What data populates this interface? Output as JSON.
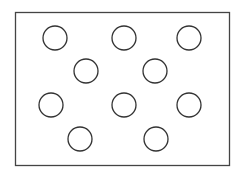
{
  "diagram": {
    "frame": {
      "x": 15,
      "y": 12,
      "width": 214,
      "height": 153,
      "stroke": "#444444"
    },
    "circle_style": {
      "r": 12,
      "stroke": "#333333",
      "stroke_width": 1.3
    },
    "circles": [
      {
        "cx": 55,
        "cy": 38
      },
      {
        "cx": 124,
        "cy": 38
      },
      {
        "cx": 189,
        "cy": 38
      },
      {
        "cx": 86,
        "cy": 71
      },
      {
        "cx": 155,
        "cy": 71
      },
      {
        "cx": 51,
        "cy": 105
      },
      {
        "cx": 124,
        "cy": 105
      },
      {
        "cx": 189,
        "cy": 105
      },
      {
        "cx": 80,
        "cy": 139
      },
      {
        "cx": 156,
        "cy": 139
      }
    ]
  }
}
